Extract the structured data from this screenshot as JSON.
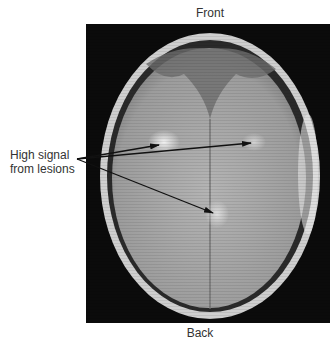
{
  "figure": {
    "top_label": "Front",
    "bottom_label": "Back",
    "annotation": {
      "line1": "High signal",
      "line2": "from lesions",
      "arrow_origin": [
        77,
        159
      ],
      "arrow_targets": [
        [
          159,
          145
        ],
        [
          251,
          143
        ],
        [
          213,
          213
        ]
      ]
    },
    "image": {
      "description": "Axial MRI brain scan (grayscale) showing bright lesions",
      "colors": {
        "background": "#0b0b0b",
        "tissue": "#a6a6a6",
        "skull": "#d8d8d8"
      }
    }
  }
}
